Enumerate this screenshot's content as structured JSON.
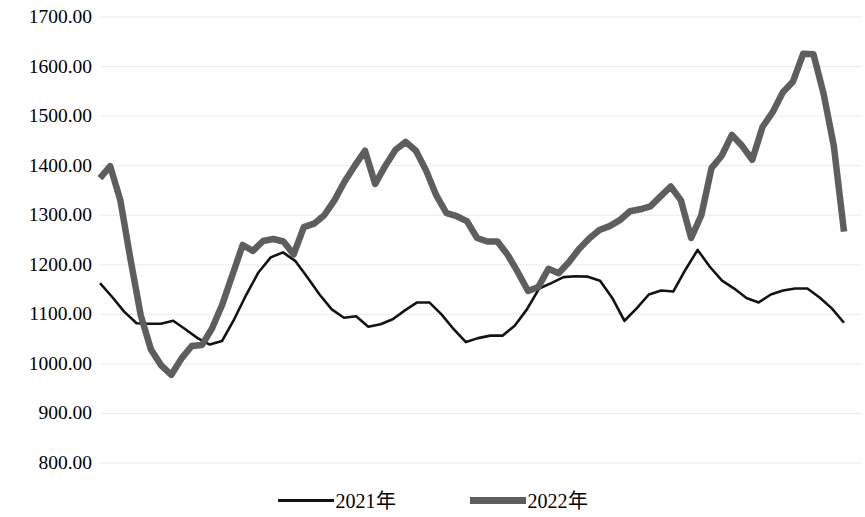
{
  "chart_data": {
    "type": "line",
    "title": "",
    "xlabel": "",
    "ylabel": "",
    "ylim": [
      800,
      1700
    ],
    "yticks": [
      1700,
      1600,
      1500,
      1400,
      1300,
      1200,
      1100,
      1000,
      900,
      800
    ],
    "ytick_labels": [
      "1700.00",
      "1600.00",
      "1500.00",
      "1400.00",
      "1300.00",
      "1200.00",
      "1100.00",
      "1000.00",
      "900.00",
      "800.00"
    ],
    "grid": true,
    "grid_style": "dotted",
    "grid_color": "#d8d8d8",
    "legend_position": "bottom",
    "x_axis_visible": false,
    "x_tick_labels": [],
    "x_points": 52,
    "series": [
      {
        "name": "2021年",
        "color": "#131313",
        "line_width": 2.6,
        "values": [
          1163,
          1135,
          1105,
          1082,
          1081,
          1081,
          1087,
          1070,
          1052,
          1039,
          1046,
          1090,
          1140,
          1185,
          1215,
          1225,
          1208,
          1175,
          1140,
          1110,
          1093,
          1096,
          1075,
          1080,
          1090,
          1108,
          1124,
          1124,
          1100,
          1070,
          1044,
          1052,
          1057,
          1057,
          1077,
          1110,
          1152,
          1163,
          1175,
          1177,
          1176,
          1168,
          1133,
          1087,
          1112,
          1140,
          1148,
          1146,
          1190,
          1230,
          1196,
          1168,
          1152,
          1133,
          1124,
          1140,
          1148,
          1152,
          1152,
          1134,
          1112,
          1083
        ]
      },
      {
        "name": "2022年",
        "color": "#5e5e5e",
        "line_width": 6.5,
        "values": [
          1375,
          1399,
          1330,
          1210,
          1098,
          1029,
          997,
          978,
          1011,
          1036,
          1038,
          1072,
          1120,
          1180,
          1240,
          1228,
          1248,
          1252,
          1247,
          1221,
          1276,
          1283,
          1300,
          1330,
          1368,
          1400,
          1430,
          1363,
          1400,
          1432,
          1448,
          1430,
          1390,
          1340,
          1304,
          1298,
          1288,
          1254,
          1247,
          1247,
          1220,
          1185,
          1147,
          1155,
          1192,
          1183,
          1205,
          1232,
          1253,
          1270,
          1278,
          1290,
          1308,
          1312,
          1318,
          1338,
          1358,
          1330,
          1254,
          1300,
          1395,
          1420,
          1462,
          1440,
          1412,
          1478,
          1508,
          1548,
          1570,
          1626,
          1625,
          1545,
          1440,
          1267
        ]
      }
    ]
  },
  "legend": {
    "items": [
      {
        "label": "2021年",
        "swatch": "thin-black-line"
      },
      {
        "label": "2022年",
        "swatch": "thick-gray-line"
      }
    ]
  },
  "axis": {
    "y_labels": [
      "1700.00",
      "1600.00",
      "1500.00",
      "1400.00",
      "1300.00",
      "1200.00",
      "1100.00",
      "1000.00",
      "900.00",
      "800.00"
    ]
  }
}
